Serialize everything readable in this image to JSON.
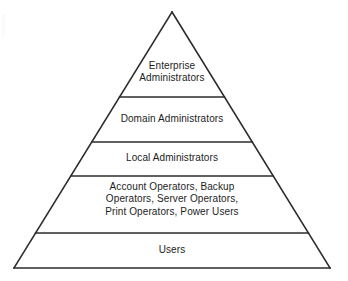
{
  "diagram": {
    "type": "pyramid",
    "background_color": "#ffffff",
    "line_color": "#2b2b2b",
    "text_color": "#1d1d1d",
    "geometry": {
      "apex_x": 172,
      "apex_y": 12,
      "base_left_x": 14,
      "base_right_x": 330,
      "base_y": 268,
      "divider_y": [
        97,
        142,
        176,
        233
      ]
    },
    "tiers": [
      {
        "id": "enterprise-administrators",
        "rank": 1,
        "lines": [
          "Enterprise",
          "Administrators"
        ],
        "text": "Enterprise Administrators",
        "top_y": 12,
        "bottom_y": 97
      },
      {
        "id": "domain-administrators",
        "rank": 2,
        "lines": [
          "Domain Administrators"
        ],
        "text": "Domain Administrators",
        "top_y": 97,
        "bottom_y": 142
      },
      {
        "id": "local-administrators",
        "rank": 3,
        "lines": [
          "Local Administrators"
        ],
        "text": "Local Administrators",
        "top_y": 142,
        "bottom_y": 176
      },
      {
        "id": "operators-and-power-users",
        "rank": 4,
        "lines": [
          "Account Operators, Backup",
          "Operators, Server Operators,",
          "Print Operators, Power Users"
        ],
        "text": "Account Operators, Backup Operators, Server Operators, Print Operators, Power Users",
        "top_y": 176,
        "bottom_y": 233
      },
      {
        "id": "users",
        "rank": 5,
        "lines": [
          "Users"
        ],
        "text": "Users",
        "top_y": 233,
        "bottom_y": 268
      }
    ]
  }
}
